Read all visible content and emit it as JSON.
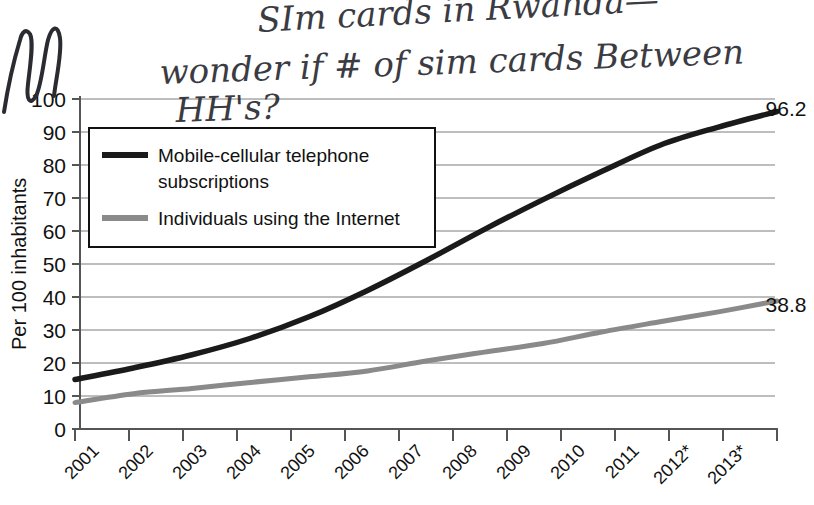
{
  "chart_data": {
    "type": "line",
    "title": "",
    "xlabel": "",
    "ylabel": "Per 100 inhabitants",
    "ylim": [
      0,
      100
    ],
    "ytick_step": 10,
    "yticks": [
      "0",
      "10",
      "20",
      "30",
      "40",
      "50",
      "60",
      "70",
      "80",
      "90",
      "100"
    ],
    "grid": true,
    "legend_position": "upper-left-inside",
    "categories": [
      "2001",
      "2002",
      "2003",
      "2004",
      "2005",
      "2006",
      "2007",
      "2008",
      "2009",
      "2010",
      "2011",
      "2012*",
      "2013*"
    ],
    "series": [
      {
        "name": "Mobile-cellular telephone subscriptions",
        "color": "#1a1a1a",
        "values": [
          15.0,
          18.5,
          22.5,
          27.5,
          34.0,
          42.0,
          51.0,
          60.5,
          69.5,
          78.0,
          86.0,
          91.5,
          96.2
        ],
        "end_label": "96.2"
      },
      {
        "name": "Individuals using the Internet",
        "color": "#8a8a8a",
        "values": [
          8.0,
          10.7,
          12.3,
          14.1,
          15.8,
          17.6,
          20.6,
          23.3,
          25.9,
          29.4,
          32.5,
          35.5,
          38.8
        ],
        "end_label": "38.8"
      }
    ]
  },
  "legend": {
    "items": [
      {
        "label_line1": "Mobile-cellular telephone",
        "label_line2": "subscriptions",
        "color": "#1a1a1a"
      },
      {
        "label_line1": "Individuals using the Internet",
        "label_line2": "",
        "color": "#8a8a8a"
      }
    ]
  },
  "end_labels": {
    "mobile": "96.2",
    "internet": "38.8"
  },
  "annotation": {
    "line1": "SIm cards in Rwanda—",
    "line2": "wonder if # of sim cards Between",
    "line3": "HH's?",
    "scribble_left": "wn",
    "ink_color": "#2b2b32"
  }
}
